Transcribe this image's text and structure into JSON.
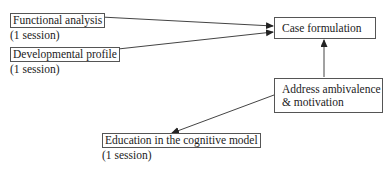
{
  "nodes": {
    "functional_analysis": {
      "label": "Functional analysis",
      "note": "(1 session)"
    },
    "developmental_profile": {
      "label": "Developmental profile",
      "note": "(1 session)"
    },
    "case_formulation": {
      "label": "Case formulation"
    },
    "address_ambivalence": {
      "line1": "Address ambivalence",
      "line2": "& motivation"
    },
    "education": {
      "label": "Education in the cognitive model",
      "note": "(1 session)"
    }
  },
  "edges": [
    {
      "from": "Functional analysis",
      "to": "Case formulation"
    },
    {
      "from": "Developmental profile",
      "to": "Case formulation"
    },
    {
      "from": "Address ambivalence & motivation",
      "to": "Case formulation"
    },
    {
      "from": "Address ambivalence & motivation",
      "to": "Education in the cognitive model"
    }
  ],
  "colors": {
    "line": "#333333",
    "border": "#555555"
  }
}
